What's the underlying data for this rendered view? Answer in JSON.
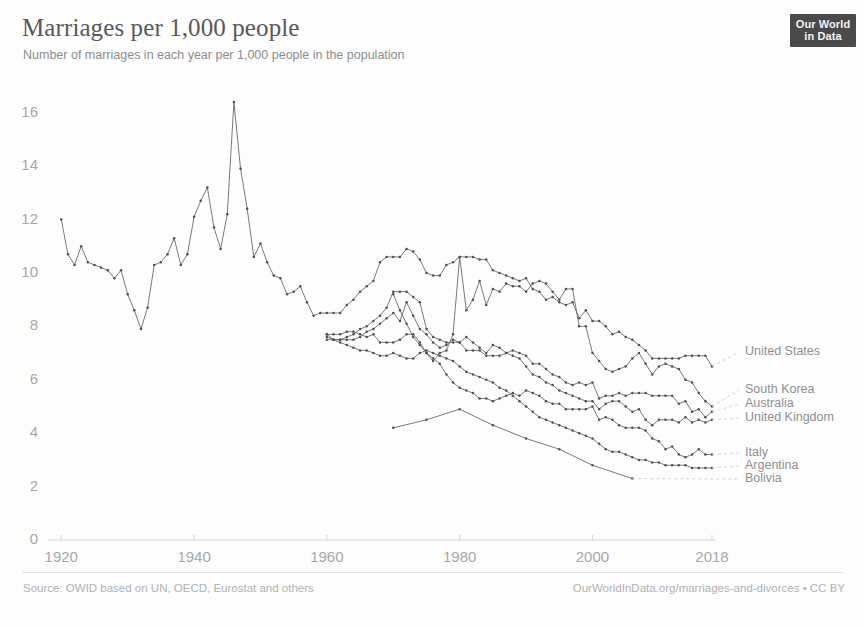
{
  "header": {
    "title": "Marriages per 1,000 people",
    "subtitle": "Number of marriages in each year per 1,000 people in the population"
  },
  "logo": {
    "line1": "Our World",
    "line2": "in Data"
  },
  "footer": {
    "source": "Source: OWID based on UN, OECD, Eurostat and others",
    "link": "OurWorldInData.org/marriages-and-divorces • CC BY"
  },
  "colors": {
    "line": "#6b6b6b",
    "axis": "#d8d8d8",
    "tick_text": "#a6a8aa",
    "legend_text": "#8e9092",
    "title": "#58595b",
    "subtitle": "#8b8d8f",
    "logo_bg": "#4a4a4a"
  },
  "chart_data": {
    "type": "line",
    "title": "Marriages per 1,000 people",
    "subtitle": "Number of marriages in each year per 1,000 people in the population",
    "xlabel": "",
    "ylabel": "",
    "xlim": [
      1918,
      2018
    ],
    "ylim": [
      0,
      17
    ],
    "xticks": [
      1920,
      1940,
      1960,
      1980,
      2000,
      2018
    ],
    "yticks": [
      0,
      2,
      4,
      6,
      8,
      10,
      12,
      14,
      16
    ],
    "grid": false,
    "legend": "right-inline-labels",
    "markers": true,
    "series": [
      {
        "name": "United States",
        "x": [
          1920,
          1921,
          1922,
          1923,
          1924,
          1925,
          1926,
          1927,
          1928,
          1929,
          1930,
          1931,
          1932,
          1933,
          1934,
          1935,
          1936,
          1937,
          1938,
          1939,
          1940,
          1941,
          1942,
          1943,
          1944,
          1945,
          1946,
          1947,
          1948,
          1949,
          1950,
          1951,
          1952,
          1953,
          1954,
          1955,
          1956,
          1957,
          1958,
          1959,
          1960,
          1961,
          1962,
          1963,
          1964,
          1965,
          1966,
          1967,
          1968,
          1969,
          1970,
          1971,
          1972,
          1973,
          1974,
          1975,
          1976,
          1977,
          1978,
          1979,
          1980,
          1981,
          1982,
          1983,
          1984,
          1985,
          1986,
          1987,
          1988,
          1989,
          1990,
          1991,
          1992,
          1993,
          1994,
          1995,
          1996,
          1997,
          1998,
          1999,
          2000,
          2001,
          2002,
          2003,
          2004,
          2005,
          2006,
          2007,
          2008,
          2009,
          2010,
          2011,
          2012,
          2013,
          2014,
          2015,
          2016,
          2017,
          2018
        ],
        "y": [
          12.0,
          10.7,
          10.3,
          11.0,
          10.4,
          10.3,
          10.2,
          10.1,
          9.8,
          10.1,
          9.2,
          8.6,
          7.9,
          8.7,
          10.3,
          10.4,
          10.7,
          11.3,
          10.3,
          10.7,
          12.1,
          12.7,
          13.2,
          11.7,
          10.9,
          12.2,
          16.4,
          13.9,
          12.4,
          10.6,
          11.1,
          10.4,
          9.9,
          9.8,
          9.2,
          9.3,
          9.5,
          8.9,
          8.4,
          8.5,
          8.5,
          8.5,
          8.5,
          8.8,
          9.0,
          9.3,
          9.5,
          9.7,
          10.4,
          10.6,
          10.6,
          10.6,
          10.9,
          10.8,
          10.5,
          10.0,
          9.9,
          9.9,
          10.3,
          10.4,
          10.6,
          10.6,
          10.6,
          10.5,
          10.5,
          10.1,
          10.0,
          9.9,
          9.8,
          9.7,
          9.8,
          9.4,
          9.3,
          9.0,
          9.1,
          8.9,
          8.8,
          8.9,
          8.3,
          8.6,
          8.2,
          8.2,
          8.0,
          7.7,
          7.8,
          7.6,
          7.5,
          7.3,
          7.1,
          6.8,
          6.8,
          6.8,
          6.8,
          6.8,
          6.9,
          6.9,
          6.9,
          6.9,
          6.5
        ]
      },
      {
        "name": "South Korea",
        "x": [
          1970,
          1971,
          1972,
          1973,
          1974,
          1975,
          1976,
          1977,
          1978,
          1979,
          1980,
          1981,
          1982,
          1983,
          1984,
          1985,
          1986,
          1987,
          1988,
          1989,
          1990,
          1991,
          1992,
          1993,
          1994,
          1995,
          1996,
          1997,
          1998,
          1999,
          2000,
          2001,
          2002,
          2003,
          2004,
          2005,
          2006,
          2007,
          2008,
          2009,
          2010,
          2011,
          2012,
          2013,
          2014,
          2015,
          2016,
          2017,
          2018
        ],
        "y": [
          9.2,
          8.6,
          8.1,
          7.6,
          7.3,
          7.0,
          6.7,
          7.0,
          7.1,
          7.7,
          10.6,
          8.6,
          9.0,
          9.7,
          8.8,
          9.4,
          9.3,
          9.6,
          9.5,
          9.5,
          9.3,
          9.6,
          9.7,
          9.6,
          9.3,
          9.0,
          9.4,
          9.4,
          8.0,
          8.0,
          7.0,
          6.7,
          6.4,
          6.3,
          6.4,
          6.5,
          6.8,
          7.0,
          6.6,
          6.2,
          6.5,
          6.6,
          6.5,
          6.4,
          6.0,
          5.9,
          5.5,
          5.2,
          5.0
        ]
      },
      {
        "name": "Australia",
        "x": [
          1960,
          1961,
          1962,
          1963,
          1964,
          1965,
          1966,
          1967,
          1968,
          1969,
          1970,
          1971,
          1972,
          1973,
          1974,
          1975,
          1976,
          1977,
          1978,
          1979,
          1980,
          1981,
          1982,
          1983,
          1984,
          1985,
          1986,
          1987,
          1988,
          1989,
          1990,
          1991,
          1992,
          1993,
          1994,
          1995,
          1996,
          1997,
          1998,
          1999,
          2000,
          2001,
          2002,
          2003,
          2004,
          2005,
          2006,
          2007,
          2008,
          2009,
          2010,
          2011,
          2012,
          2013,
          2014,
          2015,
          2016,
          2017,
          2018
        ],
        "y": [
          7.7,
          7.5,
          7.5,
          7.6,
          7.7,
          7.9,
          8.0,
          8.2,
          8.4,
          8.7,
          9.3,
          9.3,
          9.3,
          9.1,
          8.9,
          7.9,
          7.6,
          7.5,
          7.4,
          7.4,
          7.4,
          7.6,
          7.4,
          7.2,
          7.0,
          7.3,
          7.2,
          7.0,
          7.1,
          7.0,
          6.9,
          6.6,
          6.6,
          6.4,
          6.2,
          6.1,
          5.9,
          5.8,
          5.9,
          5.8,
          5.9,
          5.3,
          5.4,
          5.4,
          5.5,
          5.4,
          5.5,
          5.5,
          5.5,
          5.4,
          5.4,
          5.4,
          5.4,
          5.1,
          5.2,
          4.8,
          4.9,
          4.6,
          4.8
        ]
      },
      {
        "name": "United Kingdom",
        "x": [
          1960,
          1961,
          1962,
          1963,
          1964,
          1965,
          1966,
          1967,
          1968,
          1969,
          1970,
          1971,
          1972,
          1973,
          1974,
          1975,
          1976,
          1977,
          1978,
          1979,
          1980,
          1981,
          1982,
          1983,
          1984,
          1985,
          1986,
          1987,
          1988,
          1989,
          1990,
          1991,
          1992,
          1993,
          1994,
          1995,
          1996,
          1997,
          1998,
          1999,
          2000,
          2001,
          2002,
          2003,
          2004,
          2005,
          2006,
          2007,
          2008,
          2009,
          2010,
          2011,
          2012,
          2013,
          2014,
          2015,
          2016,
          2017,
          2018
        ],
        "y": [
          7.5,
          7.5,
          7.5,
          7.5,
          7.5,
          7.6,
          7.8,
          7.9,
          8.1,
          8.3,
          8.5,
          8.2,
          8.9,
          8.4,
          7.9,
          7.7,
          7.4,
          7.2,
          7.3,
          7.5,
          7.4,
          7.1,
          7.1,
          7.1,
          6.9,
          6.9,
          6.9,
          7.0,
          6.9,
          6.8,
          6.5,
          6.2,
          6.1,
          5.9,
          5.8,
          5.6,
          5.5,
          5.4,
          5.3,
          5.2,
          5.2,
          4.9,
          5.1,
          5.2,
          5.2,
          5.0,
          4.8,
          4.9,
          4.5,
          4.3,
          4.5,
          4.5,
          4.5,
          4.4,
          4.6,
          4.4,
          4.5,
          4.4,
          4.5
        ]
      },
      {
        "name": "Italy",
        "x": [
          1960,
          1961,
          1962,
          1963,
          1964,
          1965,
          1966,
          1967,
          1968,
          1969,
          1970,
          1971,
          1972,
          1973,
          1974,
          1975,
          1976,
          1977,
          1978,
          1979,
          1980,
          1981,
          1982,
          1983,
          1984,
          1985,
          1986,
          1987,
          1988,
          1989,
          1990,
          1991,
          1992,
          1993,
          1994,
          1995,
          1996,
          1997,
          1998,
          1999,
          2000,
          2001,
          2002,
          2003,
          2004,
          2005,
          2006,
          2007,
          2008,
          2009,
          2010,
          2011,
          2012,
          2013,
          2014,
          2015,
          2016,
          2017,
          2018
        ],
        "y": [
          7.7,
          7.7,
          7.7,
          7.8,
          7.8,
          7.7,
          7.6,
          7.7,
          7.4,
          7.4,
          7.4,
          7.5,
          7.7,
          7.7,
          7.4,
          7.0,
          6.8,
          6.6,
          6.2,
          5.9,
          5.7,
          5.6,
          5.5,
          5.3,
          5.3,
          5.2,
          5.3,
          5.4,
          5.5,
          5.4,
          5.6,
          5.5,
          5.4,
          5.2,
          5.1,
          5.1,
          4.9,
          4.9,
          4.9,
          4.9,
          5.0,
          4.5,
          4.6,
          4.5,
          4.3,
          4.2,
          4.2,
          4.2,
          4.1,
          3.8,
          3.7,
          3.4,
          3.5,
          3.2,
          3.1,
          3.2,
          3.4,
          3.2,
          3.2
        ]
      },
      {
        "name": "Argentina",
        "x": [
          1960,
          1961,
          1962,
          1963,
          1964,
          1965,
          1966,
          1967,
          1968,
          1969,
          1970,
          1971,
          1972,
          1973,
          1974,
          1975,
          1976,
          1977,
          1978,
          1979,
          1980,
          1981,
          1982,
          1983,
          1984,
          1985,
          1986,
          1987,
          1988,
          1989,
          1990,
          1991,
          1992,
          1993,
          1994,
          1995,
          1996,
          1997,
          1998,
          1999,
          2000,
          2001,
          2002,
          2003,
          2004,
          2005,
          2006,
          2007,
          2008,
          2009,
          2010,
          2011,
          2012,
          2013,
          2014,
          2015,
          2016,
          2017,
          2018
        ],
        "y": [
          7.6,
          7.5,
          7.4,
          7.3,
          7.2,
          7.1,
          7.1,
          7.0,
          6.9,
          6.9,
          7.0,
          6.9,
          6.8,
          6.8,
          7.0,
          7.1,
          7.0,
          6.9,
          6.8,
          6.7,
          6.5,
          6.3,
          6.2,
          6.1,
          6.0,
          5.9,
          5.7,
          5.6,
          5.4,
          5.2,
          5.0,
          4.8,
          4.6,
          4.5,
          4.4,
          4.3,
          4.2,
          4.1,
          4.0,
          3.9,
          3.8,
          3.6,
          3.4,
          3.3,
          3.3,
          3.2,
          3.1,
          3.0,
          3.0,
          2.9,
          2.9,
          2.8,
          2.8,
          2.8,
          2.8,
          2.7,
          2.7,
          2.7,
          2.7
        ]
      },
      {
        "name": "Bolivia",
        "x": [
          1970,
          1975,
          1980,
          1985,
          1990,
          1995,
          2000,
          2006
        ],
        "y": [
          4.2,
          4.5,
          4.9,
          4.3,
          3.8,
          3.4,
          2.8,
          2.3
        ]
      }
    ]
  },
  "axis": {
    "y_ticks": [
      "0",
      "2",
      "4",
      "6",
      "8",
      "10",
      "12",
      "14",
      "16"
    ],
    "x_ticks": [
      "1920",
      "1940",
      "1960",
      "1980",
      "2000",
      "2018"
    ]
  },
  "legend": {
    "entries": [
      {
        "label": "United States"
      },
      {
        "label": "South Korea"
      },
      {
        "label": "Australia"
      },
      {
        "label": "United Kingdom"
      },
      {
        "label": "Italy"
      },
      {
        "label": "Argentina"
      },
      {
        "label": "Bolivia"
      }
    ]
  }
}
